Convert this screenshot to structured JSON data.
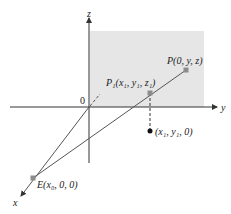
{
  "diagram": {
    "axes": {
      "z_label": "z",
      "y_label": "y",
      "x_label": "x",
      "origin_label": "0"
    },
    "points": {
      "P": {
        "label": "P(0, y, z)"
      },
      "P1": {
        "label": "P₁(x₁, y₁, z₁)"
      },
      "E": {
        "label": "E(x₀, 0, 0)"
      },
      "proj": {
        "label": "(x₁, y₁, 0)"
      }
    },
    "colors": {
      "plane_fill": "#e6e6e6",
      "axis": "#333333",
      "ray": "#555555",
      "point_marker": "#8c8c8c",
      "projected_point": "#111111"
    }
  }
}
